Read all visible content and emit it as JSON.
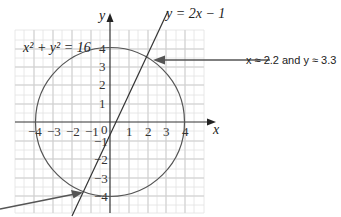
{
  "diagram": {
    "circle_equation": "x² + y² = 16",
    "line_equation": "y = 2x − 1",
    "x_axis_label": "x",
    "y_axis_label": "y",
    "x_ticks": [
      "−4",
      "−3",
      "−2",
      "−1",
      "0",
      "1",
      "2",
      "3",
      "4"
    ],
    "y_ticks": [
      "4",
      "3",
      "2",
      "1",
      "−1",
      "−2",
      "−3",
      "−4"
    ],
    "annotation_upper": "x ≈ 2.2 and y ≈ 3.3",
    "colors": {
      "grid": "#dcdcdc",
      "axis": "#333333",
      "curve": "#555555",
      "arrow": "#555555"
    }
  }
}
